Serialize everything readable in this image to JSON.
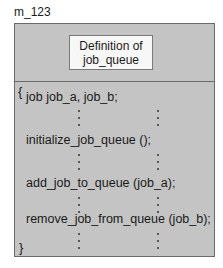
{
  "diagram": {
    "module_label": "m_123",
    "definition_box": {
      "line1": "Definition of",
      "line2": "job_queue"
    },
    "code": {
      "open_brace": "{",
      "close_brace": "}",
      "lines": [
        "job job_a, job_b;",
        "initialize_job_queue ();",
        "add_job_to_queue (job_a);",
        "remove_job_from_queue (job_b);"
      ],
      "ellipsis": "vertical dots between lines"
    },
    "colors": {
      "box_fill": "#c4c4c4",
      "definition_fill": "#f7f7f7",
      "border": "#6a6a6a"
    }
  }
}
